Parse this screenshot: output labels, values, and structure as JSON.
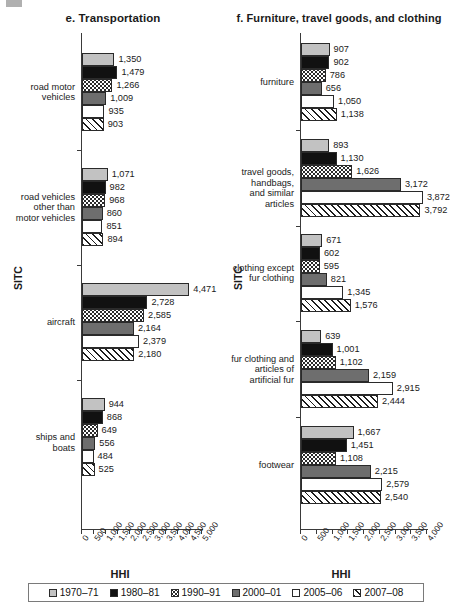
{
  "legend": {
    "position": "bottom",
    "entries": [
      {
        "label": "1970–71",
        "pattern": "light-gray-fill"
      },
      {
        "label": "1980–81",
        "pattern": "black-fill"
      },
      {
        "label": "1990–91",
        "pattern": "dotted-fill"
      },
      {
        "label": "2000–01",
        "pattern": "dark-gray-fill"
      },
      {
        "label": "2005–06",
        "pattern": "white-fill"
      },
      {
        "label": "2007–08",
        "pattern": "diagonal-hatch-fill"
      }
    ]
  },
  "chart_data": [
    {
      "type": "bar",
      "orientation": "horizontal",
      "title": "e. Transportation",
      "xlabel": "HHI",
      "ylabel": "SITC",
      "xlim": [
        0,
        5000
      ],
      "grid": false,
      "xticks": [
        "0",
        "500",
        "1,000",
        "1,500",
        "2,000",
        "2,500",
        "3,000",
        "3,500",
        "4,000",
        "4,500",
        "5,000"
      ],
      "xtick_values": [
        0,
        500,
        1000,
        1500,
        2000,
        2500,
        3000,
        3500,
        4000,
        4500,
        5000
      ],
      "categories": [
        "road motor\nvehicles",
        "road vehicles\nother than\nmotor vehicles",
        "aircraft",
        "ships and boats"
      ],
      "series": [
        {
          "name": "1970–71",
          "values": [
            1350,
            1071,
            4471,
            944
          ]
        },
        {
          "name": "1980–81",
          "values": [
            1479,
            982,
            2728,
            868
          ]
        },
        {
          "name": "1990–91",
          "values": [
            1266,
            968,
            2585,
            649
          ]
        },
        {
          "name": "2000–01",
          "values": [
            1009,
            860,
            2164,
            556
          ]
        },
        {
          "name": "2005–06",
          "values": [
            935,
            851,
            2379,
            484
          ]
        },
        {
          "name": "2007–08",
          "values": [
            903,
            894,
            2180,
            525
          ]
        }
      ],
      "value_labels": [
        [
          "1,350",
          "1,479",
          "1,266",
          "1,009",
          "935",
          "903"
        ],
        [
          "1,071",
          "982",
          "968",
          "860",
          "851",
          "894"
        ],
        [
          "4,471",
          "2,728",
          "2,585",
          "2,164",
          "2,379",
          "2,180"
        ],
        [
          "944",
          "868",
          "649",
          "556",
          "484",
          "525"
        ]
      ]
    },
    {
      "type": "bar",
      "orientation": "horizontal",
      "title": "f. Furniture, travel goods, and clothing",
      "xlabel": "HHI",
      "ylabel": "SITC",
      "xlim": [
        0,
        4000
      ],
      "grid": false,
      "xticks": [
        "0",
        "500",
        "1,000",
        "1,500",
        "2,000",
        "2,500",
        "3,000",
        "3,500",
        "4,000"
      ],
      "xtick_values": [
        0,
        500,
        1000,
        1500,
        2000,
        2500,
        3000,
        3500,
        4000
      ],
      "categories": [
        "furniture",
        "travel goods, handbags,\nand similar articles",
        "clothing except\nfur clothing",
        "fur clothing and\narticles of\nartificial fur",
        "footwear"
      ],
      "series": [
        {
          "name": "1970–71",
          "values": [
            907,
            893,
            671,
            639,
            1667
          ]
        },
        {
          "name": "1980–81",
          "values": [
            902,
            1130,
            602,
            1001,
            1451
          ]
        },
        {
          "name": "1990–91",
          "values": [
            786,
            1626,
            595,
            1102,
            1108
          ]
        },
        {
          "name": "2000–01",
          "values": [
            656,
            3172,
            821,
            2159,
            2215
          ]
        },
        {
          "name": "2005–06",
          "values": [
            1050,
            3872,
            1345,
            2915,
            2579
          ]
        },
        {
          "name": "2007–08",
          "values": [
            1138,
            3792,
            1576,
            2444,
            2540
          ]
        }
      ],
      "value_labels": [
        [
          "907",
          "902",
          "786",
          "656",
          "1,050",
          "1,138"
        ],
        [
          "893",
          "1,130",
          "1,626",
          "3,172",
          "3,872",
          "3,792"
        ],
        [
          "671",
          "602",
          "595",
          "821",
          "1,345",
          "1,576"
        ],
        [
          "639",
          "1,001",
          "1,102",
          "2,159",
          "2,915",
          "2,444"
        ],
        [
          "1,667",
          "1,451",
          "1,108",
          "2,215",
          "2,579",
          "2,540"
        ]
      ]
    }
  ]
}
